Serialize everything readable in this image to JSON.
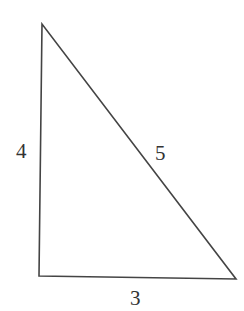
{
  "diagram": {
    "type": "right-triangle",
    "vertices": {
      "top": [
        42,
        24
      ],
      "bottom_left": [
        39,
        276
      ],
      "bottom_right": [
        236,
        279
      ]
    },
    "stroke_color": "#444444",
    "sides": [
      {
        "id": "left",
        "label": "4"
      },
      {
        "id": "hypotenuse",
        "label": "5"
      },
      {
        "id": "bottom",
        "label": "3"
      }
    ]
  }
}
